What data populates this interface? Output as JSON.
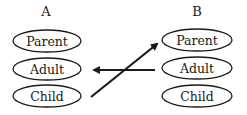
{
  "diagram": {
    "columns": [
      {
        "label": "A",
        "items": [
          {
            "label": "Parent"
          },
          {
            "label": "Adult"
          },
          {
            "label": "Child"
          }
        ]
      },
      {
        "label": "B",
        "items": [
          {
            "label": "Parent"
          },
          {
            "label": "Adult"
          },
          {
            "label": "Child"
          }
        ]
      }
    ],
    "arrows": [
      {
        "from": "A.Child",
        "to": "B.Parent"
      },
      {
        "from": "B.Adult",
        "to": "A.Adult"
      }
    ],
    "colors": {
      "stroke": "#1a1a1a",
      "background": "#ffffff"
    }
  }
}
